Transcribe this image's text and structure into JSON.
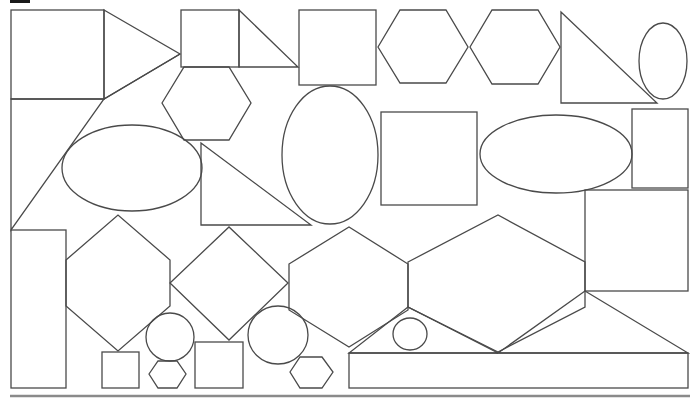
{
  "diagram": {
    "type": "shape-collage",
    "width": 699,
    "height": 399,
    "stroke_color": "#4a4a4a",
    "background": "#ffffff",
    "bottom_rule": {
      "x1": 10,
      "y1": 396,
      "x2": 690,
      "y2": 396,
      "color": "#8a8a8a"
    },
    "corner_mark": {
      "x": 10,
      "y": 0,
      "w": 20,
      "h": 3
    },
    "shapes": [
      {
        "kind": "rect",
        "name": "square-top-left",
        "x": 11,
        "y": 10,
        "w": 93,
        "h": 89
      },
      {
        "kind": "polygon",
        "name": "triangle-top-left",
        "points": "104,10 180,54 104,99"
      },
      {
        "kind": "rect",
        "name": "square-small-top",
        "x": 181,
        "y": 10,
        "w": 58,
        "h": 57
      },
      {
        "kind": "polygon",
        "name": "triangle-right-top",
        "points": "239,10 298,67 239,67"
      },
      {
        "kind": "rect",
        "name": "square-top-middle",
        "x": 299,
        "y": 10,
        "w": 77,
        "h": 75
      },
      {
        "kind": "polygon",
        "name": "hexagon-top-1",
        "points": "378,47 400,10 446,10 468,47 446,83 400,83"
      },
      {
        "kind": "polygon",
        "name": "hexagon-top-2",
        "points": "470,47 492,10 538,10 560,47 538,84 492,84"
      },
      {
        "kind": "polygon",
        "name": "triangle-top-right",
        "points": "561,12 657,103 561,103"
      },
      {
        "kind": "ellipse",
        "name": "ellipse-top-right",
        "cx": 663,
        "cy": 61,
        "rx": 24,
        "ry": 38
      },
      {
        "kind": "polygon",
        "name": "hexagon-below-square",
        "points": "162,103 184,67 229,67 251,103 229,140 184,140"
      },
      {
        "kind": "polygon",
        "name": "triangle-left-large",
        "points": "11,99 104,99 11,230"
      },
      {
        "kind": "line",
        "name": "triangle-left-edge",
        "x1": 104,
        "y1": 99,
        "x2": 180,
        "y2": 54
      },
      {
        "kind": "ellipse",
        "name": "ellipse-left",
        "cx": 132,
        "cy": 168,
        "rx": 70,
        "ry": 43
      },
      {
        "kind": "polygon",
        "name": "triangle-middle",
        "points": "201,143 311,225 201,225"
      },
      {
        "kind": "ellipse",
        "name": "ellipse-tall-center",
        "cx": 330,
        "cy": 155,
        "rx": 48,
        "ry": 69
      },
      {
        "kind": "rect",
        "name": "square-center",
        "x": 381,
        "y": 112,
        "w": 96,
        "h": 93
      },
      {
        "kind": "ellipse",
        "name": "ellipse-right",
        "cx": 556,
        "cy": 154,
        "rx": 76,
        "ry": 39
      },
      {
        "kind": "rect",
        "name": "rect-right-small",
        "x": 632,
        "y": 109,
        "w": 56,
        "h": 79
      },
      {
        "kind": "rect",
        "name": "rect-right-middle",
        "x": 585,
        "y": 190,
        "w": 103,
        "h": 101
      },
      {
        "kind": "rect",
        "name": "rect-tall-left",
        "x": 11,
        "y": 230,
        "w": 55,
        "h": 158
      },
      {
        "kind": "polygon",
        "name": "hexagon-left-large",
        "points": "66,260 118,215 170,260 170,306 118,351 66,306"
      },
      {
        "kind": "polygon",
        "name": "diamond-center-left",
        "points": "170,283 229,227 288,283 229,340"
      },
      {
        "kind": "polygon",
        "name": "hexagon-center",
        "points": "289,264 349,227 408,264 408,310 349,347 289,310"
      },
      {
        "kind": "polygon",
        "name": "hexagon-wide-right",
        "points": "408,262 498,215 585,262 585,307 498,352 408,307"
      },
      {
        "kind": "polygon",
        "name": "triangle-bottom-left-small",
        "points": "408,307 349,353 498,353"
      },
      {
        "kind": "polygon",
        "name": "triangle-bottom-right",
        "points": "585,291 688,353 498,353"
      },
      {
        "kind": "ellipse",
        "name": "circle-bottom-1",
        "cx": 170,
        "cy": 337,
        "rx": 24,
        "ry": 24
      },
      {
        "kind": "ellipse",
        "name": "circle-bottom-2",
        "cx": 278,
        "cy": 335,
        "rx": 30,
        "ry": 29
      },
      {
        "kind": "ellipse",
        "name": "circle-bottom-3",
        "cx": 410,
        "cy": 334,
        "rx": 17,
        "ry": 16
      },
      {
        "kind": "rect",
        "name": "square-bottom-1",
        "x": 102,
        "y": 352,
        "w": 37,
        "h": 36
      },
      {
        "kind": "polygon",
        "name": "hexagon-bottom-small-1",
        "points": "149,374 158,361 177,361 186,374 177,388 158,388"
      },
      {
        "kind": "rect",
        "name": "square-bottom-2",
        "x": 195,
        "y": 342,
        "w": 48,
        "h": 46
      },
      {
        "kind": "polygon",
        "name": "hexagon-bottom-small-2",
        "points": "290,372 300,357 322,357 333,372 322,388 300,388"
      },
      {
        "kind": "rect",
        "name": "rect-bottom-wide",
        "x": 349,
        "y": 353,
        "w": 339,
        "h": 35
      }
    ]
  }
}
